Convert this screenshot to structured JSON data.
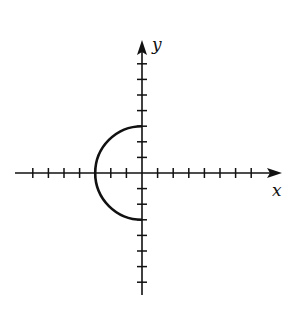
{
  "chart_data": {
    "type": "line",
    "title": "",
    "xlabel": "x",
    "ylabel": "y",
    "xlim": [
      -8,
      8
    ],
    "ylim": [
      -8,
      8
    ],
    "grid": false,
    "x_ticks": [
      -7,
      -6,
      -5,
      -4,
      -3,
      -2,
      -1,
      1,
      2,
      3,
      4,
      5,
      6,
      7
    ],
    "y_ticks": [
      -7,
      -6,
      -5,
      -4,
      -3,
      -2,
      -1,
      1,
      2,
      3,
      4,
      5,
      6,
      7
    ],
    "tick_labels_shown": false,
    "series": [
      {
        "name": "left semicircle x = -sqrt(9 - y^2)",
        "center": [
          0,
          0
        ],
        "radius": 3,
        "points": [
          [
            0,
            3
          ],
          [
            -1.5,
            2.6
          ],
          [
            -2.6,
            1.5
          ],
          [
            -3,
            0
          ],
          [
            -2.6,
            -1.5
          ],
          [
            -1.5,
            -2.6
          ],
          [
            0,
            -3
          ]
        ]
      }
    ]
  },
  "labels": {
    "x_axis": "x",
    "y_axis": "y"
  },
  "colors": {
    "ink": "#111111",
    "background": "#ffffff"
  }
}
